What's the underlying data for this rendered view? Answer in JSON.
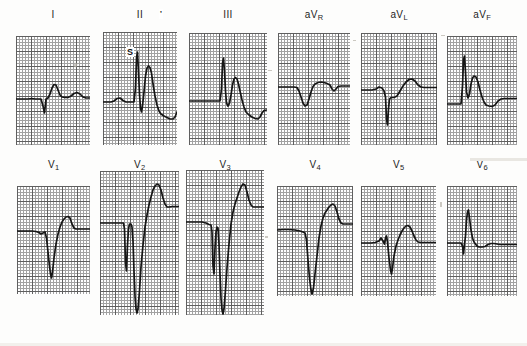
{
  "document": {
    "kind": "12-lead electrocardiogram",
    "title": "12-lead ECG tracing sheet",
    "background_color": "#fdfdfc",
    "trace_color": "#161616",
    "grid_minor_color": "#8e8e8e",
    "grid_major_color": "#3c3c3c"
  },
  "annotations": [
    {
      "id": "s-marker",
      "text": "S",
      "lead": "II",
      "x": 126,
      "y": 52
    },
    {
      "id": "tick-mark",
      "text": "'",
      "lead": "II",
      "x": 159,
      "y": 13
    }
  ],
  "grid": {
    "minor_step_px": 3,
    "major_every": 5,
    "paper_speed": "25 mm/s",
    "calibration": "10 mm/mV"
  },
  "rows": [
    {
      "row_index": 0,
      "leads": [
        {
          "name": "I",
          "label_main": "I",
          "label_sub": "",
          "panel": {
            "x": 16,
            "y": 36,
            "w": 74,
            "h": 109
          },
          "baseline_y": 0.58,
          "trace": "M0,63 L6,63 L12,63 L16,62.5 L19,63 L22,63 L25,63 L27,70 L28.5,77 L30,63 L32,62 L34,58 L36,52 L38,48.5 L40,49 L42,54 L44,59 L46,61 L49,61.5 L52,61.5 L55,60 L58,57.5 L61,56.5 L64,58 L67,61 L70,62 L74,62 L78,62 L82,62"
        },
        {
          "name": "II",
          "label_main": "II",
          "label_sub": "",
          "panel": {
            "x": 103,
            "y": 32,
            "w": 74,
            "h": 113
          },
          "baseline_y": 0.6,
          "trace": "M0,70 L5,70 L8,70 L11,69 L14,66.5 L17,66 L20,68.5 L23,70 L26,70 L29,70 L31,70 L32.5,56 L33.5,26 L34.5,20 L35.5,40 L36.5,62 L37.5,76 L38.5,80 L39.5,74 L41,60 L42.5,44 L44,36 L45.5,34 L47,35.5 L48.5,41 L50,52 L52,64 L54,73 L56,79 L58,82 L61,84 L64,85.5 L67,87 L70,87 L72,85 L74,80 L76,77 L79,77 L82,77 L86,77"
        },
        {
          "name": "III",
          "label_main": "III",
          "label_sub": "",
          "panel": {
            "x": 189,
            "y": 33,
            "w": 78,
            "h": 112
          },
          "baseline_y": 0.63,
          "trace": "M0,68 L6,68 L12,68 L18,68 L24,68 L28,68 L31,68 L32.5,56 L33.5,30 L34.5,25 L35.5,38 L36.5,58 L37.5,70 L39,73 L40.5,70 L42,62 L43.5,52 L45,46 L46.5,44.5 L48,46 L49.5,51 L51,58 L53,67 L55,74 L57,79 L60,82 L63,84 L66,85.5 L69,86 L71,84 L73,80 L75,77.5 L78,77 L82,77 L86,77"
        },
        {
          "name": "aVR",
          "label_main": "aV",
          "label_sub": "R",
          "panel": {
            "x": 278,
            "y": 33,
            "w": 72,
            "h": 112
          },
          "baseline_y": 0.48,
          "trace": "M0,54 L6,54 L12,54 L16,54 L19,54.5 L21,58 L23,64 L25,70 L27,73 L29,72 L31,66 L33,59 L35,53.5 L37,51 L40,49.5 L43,49 L46,49.5 L49,50.5 L52,52 L54,56 L56,58 L58,56 L60,53.5 L63,53 L66,53 L70,53 L74,53"
        },
        {
          "name": "aVL",
          "label_main": "aV",
          "label_sub": "L",
          "panel": {
            "x": 361,
            "y": 33,
            "w": 76,
            "h": 112
          },
          "baseline_y": 0.5,
          "trace": "M0,57 L6,57 L11,57 L15,56 L18,54 L21,55 L23,58 L24.5,64 L25.5,86 L26.5,92 L27.5,76 L28.5,66 L30,64.5 L33,64.5 L36,63 L39,58 L42,53 L45,49 L48,46.5 L51,46 L54,48 L57,52 L60,54 L63,54.5 L67,54.5 L71,54.5 L76,54.5"
        },
        {
          "name": "aVF",
          "label_main": "aV",
          "label_sub": "F",
          "panel": {
            "x": 447,
            "y": 36,
            "w": 70,
            "h": 109
          },
          "baseline_y": 0.62,
          "trace": "M0,68 L5,68 L9,68 L12,68 L14,68 L15.5,50 L16.5,24 L17.5,20 L18.5,36 L19.5,56 L21,62 L22.5,58 L24,48 L25.5,42 L27,40 L29,41 L31,46 L33,54 L35,61 L37,66 L39,69 L42,70 L45,70.5 L48,69 L51,65 L54,63 L57,62.5 L60,62.5 L64,62.5 L70,62.5"
        }
      ]
    },
    {
      "row_index": 1,
      "leads": [
        {
          "name": "V1",
          "label_main": "V",
          "label_sub": "1",
          "panel": {
            "x": 17,
            "y": 186,
            "w": 73,
            "h": 108
          },
          "baseline_y": 0.42,
          "trace": "M0,45 L6,45 L11,45 L15,45 L19,45.5 L22,46.5 L24,48 L26,47 L28,46 L29.5,52 L31,66 L32.5,80 L33.5,88 L34.5,92 L35.5,86 L37,72 L39,58 L41,48 L43,41 L45,36 L47,33 L49,31 L51,30.5 L53,32 L55,38 L57,42 L59,43 L62,43 L66,43 L70,43 L73,43"
        },
        {
          "name": "V2",
          "label_main": "V",
          "label_sub": "2",
          "panel": {
            "x": 100,
            "y": 171,
            "w": 79,
            "h": 144
          },
          "baseline_y": 0.37,
          "trace": "M0,52 L6,52 L12,52 L17,52 L21,52 L23.5,52 L24.5,58 L25.5,92 L26.5,100 L27.5,74 L28.5,58 L29.5,53 L31,53 L32,56 L33,70 L34,100 L35,125 L36,138 L37,142 L38,138 L39.5,120 L41,96 L43,74 L45,56 L47,44 L49,34 L51,26 L53,19 L55,15 L57,13 L59,14 L61,19 L63,27 L65,33 L67,36 L69,36 L72,35.5 L76,35.5 L79,35.5"
        },
        {
          "name": "V3",
          "label_main": "V",
          "label_sub": "3",
          "panel": {
            "x": 186,
            "y": 170,
            "w": 78,
            "h": 145
          },
          "baseline_y": 0.37,
          "trace": "M0,52 L6,52 L11,52 L16,52 L20,53 L23,54.5 L25,55 L26,62 L27,96 L28,104 L29,78 L30,62 L31,57 L32,58 L33,74 L34,104 L35,128 L36,140 L37,144 L38,139 L39.5,120 L41,98 L43,74 L45,54 L47,42 L49,34 L51,28 L53,22 L55,17 L57,14 L59,15 L61,22 L63,30 L65,35 L67,37 L70,37 L74,37 L78,37"
        },
        {
          "name": "V4",
          "label_main": "V",
          "label_sub": "4",
          "panel": {
            "x": 277,
            "y": 186,
            "w": 76,
            "h": 110
          },
          "baseline_y": 0.4,
          "trace": "M0,44 L6,43.5 L12,43.5 L18,44 L23,45 L26,46 L28,47 L29.5,54 L31,74 L32.5,92 L34,104 L35,108 L36.5,102 L38,88 L40,70 L42,52 L44,40 L46,32 L48,27 L50,24 L52,21 L54,19 L56,18 L58,20 L60,26 L62,33 L64,37 L66,38 L69,38 L73,38 L76,38"
        },
        {
          "name": "V5",
          "label_main": "V",
          "label_sub": "5",
          "panel": {
            "x": 361,
            "y": 186,
            "w": 75,
            "h": 110
          },
          "baseline_y": 0.52,
          "trace": "M0,57 L5,57 L10,57 L14,56.5 L18,55 L20,52 L22,55 L23.5,58 L24.5,52 L25.5,50 L26.5,56 L28,72 L29.5,84 L30.5,88 L31.5,82 L33,70 L35,60 L37,54 L39,49 L41,45 L43,42 L45,40 L47,39.5 L49,41 L51,45 L53,50 L55,54 L57,56 L60,56.5 L64,56.5 L68,56.5 L75,56.5"
        },
        {
          "name": "V6",
          "label_main": "V",
          "label_sub": "6",
          "panel": {
            "x": 447,
            "y": 186,
            "w": 70,
            "h": 110
          },
          "baseline_y": 0.52,
          "trace": "M0,57 L5,57 L9,57 L12,57 L14,57 L15.5,60 L16.5,68 L17.5,58 L18.5,50 L19.5,34 L20.5,26 L21.5,24 L22.5,32 L24,44 L25.5,52 L27,56 L28.5,58 L30,60 L32,61 L35,61 L38,60.5 L41,58.5 L44,57.5 L47,57.5 L50,58 L53,58.5 L57,58.5 L62,58.5 L70,58.5"
        }
      ]
    }
  ],
  "labels": {
    "row0": [
      "I",
      "II",
      "III",
      "aVR",
      "aVL",
      "aVF"
    ],
    "row1": [
      "V1",
      "V2",
      "V3",
      "V4",
      "V5",
      "V6"
    ]
  }
}
